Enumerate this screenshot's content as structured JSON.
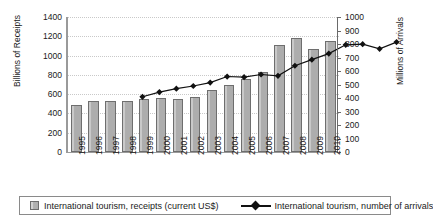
{
  "chart_data": {
    "type": "bar",
    "title": "",
    "subtitle": "",
    "xlabel": "",
    "ylabel": "Billions of Receipts",
    "y2label": "Millions of Arrivals",
    "grid": true,
    "legend_position": "bottom",
    "categories": [
      "1995",
      "1996",
      "1997",
      "1998",
      "1999",
      "2000",
      "2001",
      "2002",
      "2003",
      "2004",
      "2005",
      "2006",
      "2007",
      "2008",
      "2009",
      "2010"
    ],
    "ylim": [
      0,
      1400
    ],
    "yticks": [
      0,
      200,
      400,
      600,
      800,
      1000,
      1200,
      1400
    ],
    "y2lim": [
      0,
      1000
    ],
    "y2ticks": [
      0,
      100,
      200,
      300,
      400,
      500,
      600,
      700,
      800,
      900,
      1000
    ],
    "series": [
      {
        "name": "International tourism, receipts (current US$)",
        "kind": "bar",
        "axis": "left",
        "color": "#b3b3b3",
        "edge_color": "#6e6e6e",
        "values": [
          490,
          525,
          525,
          525,
          550,
          560,
          550,
          570,
          640,
          700,
          760,
          830,
          1110,
          1180,
          1070,
          1150
        ]
      },
      {
        "name": "International tourism, number of arrivals",
        "kind": "line",
        "axis": "right",
        "color": "#111111",
        "marker": "diamond",
        "values": [
          535,
          570,
          595,
          615,
          640,
          685,
          680,
          700,
          690,
          765,
          810,
          855,
          920,
          925,
          890,
          940
        ]
      }
    ]
  },
  "axes": {
    "left": {
      "title": "Billions of Receipts",
      "tick_labels": [
        "1400",
        "1200",
        "1000",
        "800",
        "600",
        "400",
        "200",
        "0"
      ]
    },
    "right": {
      "title": "Millions of Arrivals",
      "tick_labels": [
        "1000",
        "900",
        "800",
        "700",
        "600",
        "500",
        "400",
        "300",
        "200",
        "100",
        "0"
      ]
    },
    "bottom": {
      "tick_labels": [
        "1995",
        "1996",
        "1997",
        "1998",
        "1999",
        "2000",
        "2001",
        "2002",
        "2003",
        "2004",
        "2005",
        "2006",
        "2007",
        "2008",
        "2009",
        "2010"
      ]
    }
  },
  "legend": {
    "items": [
      {
        "label": "International tourism, receipts (current US$)",
        "marker": "square-swatch"
      },
      {
        "label": "International tourism, number of arrivals",
        "marker": "line-diamond"
      }
    ]
  },
  "colors": {
    "bar_fill": "#b3b3b3",
    "bar_edge": "#6e6e6e",
    "line": "#111111",
    "grid": "#c9c9c9",
    "axis": "#9a9a9a",
    "background": "#ffffff"
  }
}
